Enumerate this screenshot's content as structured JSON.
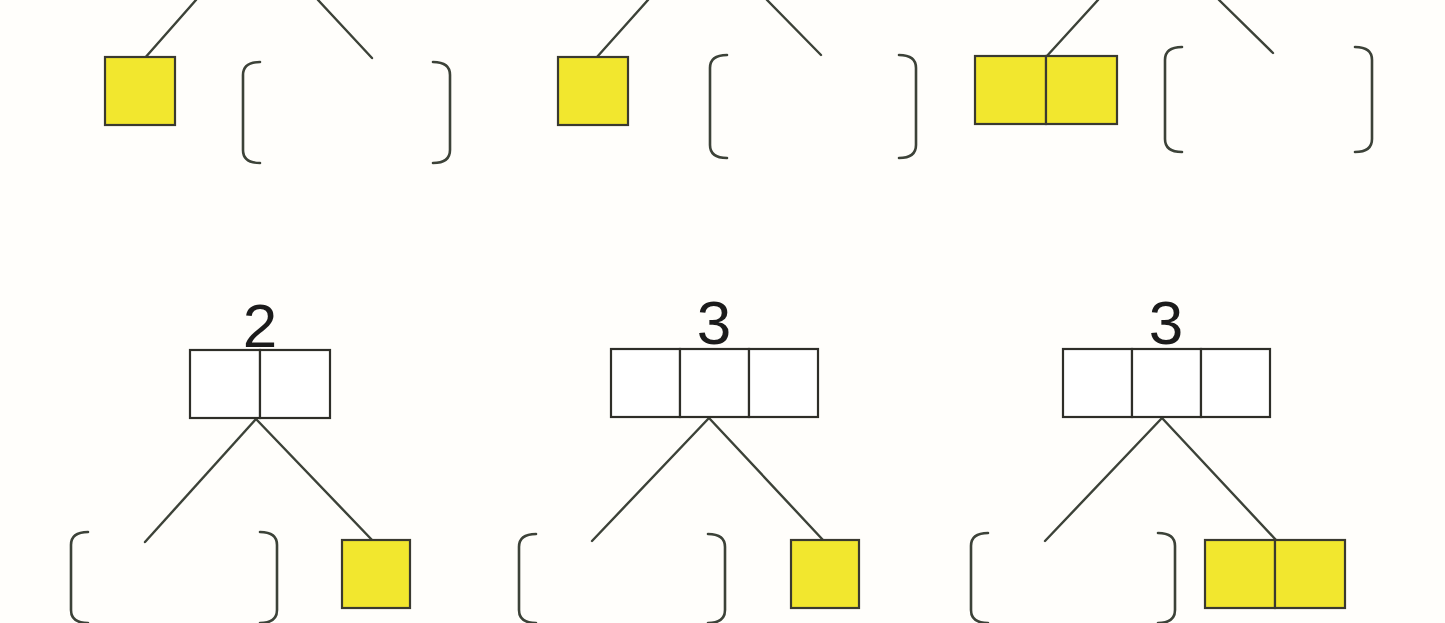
{
  "page": {
    "background_color": "#fffefb",
    "width": 1445,
    "height": 623
  },
  "palette": {
    "tile_fill": "#f2e72e",
    "tile_stroke": "#3a3a30",
    "empty_fill": "#ffffff",
    "empty_stroke": "#2e2e28",
    "connector_stroke": "#3c4238",
    "bracket_stroke": "#3c4238",
    "numeral_color": "#1b1b1b"
  },
  "stroke_widths": {
    "tile": 2.2,
    "empty": 2.2,
    "connector": 2.4,
    "bracket": 2.6
  },
  "groups": [
    {
      "id": "group-top-left",
      "row": "top",
      "column": 1,
      "label": null,
      "tile_group": {
        "name": "yellow-tile-group",
        "cells": 1,
        "fill": "#f2e72e",
        "x": 105,
        "y": 57,
        "cell_width": 70,
        "cell_height": 68
      },
      "bracket_pair": {
        "name": "empty-bracket-pair",
        "left_x": 243,
        "right_x": 450,
        "top_y": 62,
        "bottom_y": 163,
        "arm_length": 17
      },
      "connectors": [
        {
          "name": "connector-left",
          "x1": 196,
          "y1": 0,
          "x2": 144,
          "y2": 59
        },
        {
          "name": "connector-right",
          "x1": 318,
          "y1": 0,
          "x2": 372,
          "y2": 58
        }
      ]
    },
    {
      "id": "group-top-middle",
      "row": "top",
      "column": 2,
      "label": null,
      "tile_group": {
        "name": "yellow-tile-group",
        "cells": 1,
        "fill": "#f2e72e",
        "x": 558,
        "y": 57,
        "cell_width": 70,
        "cell_height": 68
      },
      "bracket_pair": {
        "name": "empty-bracket-pair",
        "left_x": 710,
        "right_x": 916,
        "top_y": 55,
        "bottom_y": 158,
        "arm_length": 17
      },
      "connectors": [
        {
          "name": "connector-left",
          "x1": 648,
          "y1": 0,
          "x2": 597,
          "y2": 57
        },
        {
          "name": "connector-right",
          "x1": 767,
          "y1": 0,
          "x2": 821,
          "y2": 55
        }
      ]
    },
    {
      "id": "group-top-right",
      "row": "top",
      "column": 3,
      "label": null,
      "tile_group": {
        "name": "yellow-tile-group",
        "cells": 2,
        "fill": "#f2e72e",
        "x": 975,
        "y": 56,
        "cell_width": 71,
        "cell_height": 68
      },
      "bracket_pair": {
        "name": "empty-bracket-pair",
        "left_x": 1165,
        "right_x": 1372,
        "top_y": 47,
        "bottom_y": 152,
        "arm_length": 17
      },
      "connectors": [
        {
          "name": "connector-left",
          "x1": 1098,
          "y1": 0,
          "x2": 1046,
          "y2": 57
        },
        {
          "name": "connector-right",
          "x1": 1219,
          "y1": 0,
          "x2": 1273,
          "y2": 53
        }
      ]
    },
    {
      "id": "group-bottom-left",
      "row": "bottom",
      "column": 1,
      "label": "2",
      "label_x": 260,
      "label_y": 295,
      "empty_group": {
        "name": "empty-tile-group",
        "cells": 2,
        "x": 190,
        "y": 350,
        "cell_width": 70,
        "cell_height": 68
      },
      "tile_group": {
        "name": "yellow-tile-group",
        "cells": 1,
        "fill": "#f2e72e",
        "x": 342,
        "y": 540,
        "cell_width": 68,
        "cell_height": 68
      },
      "bracket_pair": {
        "name": "empty-bracket-pair",
        "left_x": 71,
        "right_x": 277,
        "top_y": 532,
        "bottom_y": 623,
        "arm_length": 17
      },
      "connectors": [
        {
          "name": "connector-left",
          "x1": 256,
          "y1": 419,
          "x2": 145,
          "y2": 542
        },
        {
          "name": "connector-right",
          "x1": 256,
          "y1": 419,
          "x2": 373,
          "y2": 541
        }
      ]
    },
    {
      "id": "group-bottom-middle",
      "row": "bottom",
      "column": 2,
      "label": "3",
      "label_x": 714,
      "label_y": 292,
      "empty_group": {
        "name": "empty-tile-group",
        "cells": 3,
        "x": 611,
        "y": 349,
        "cell_width": 69,
        "cell_height": 68
      },
      "tile_group": {
        "name": "yellow-tile-group",
        "cells": 1,
        "fill": "#f2e72e",
        "x": 791,
        "y": 540,
        "cell_width": 68,
        "cell_height": 68
      },
      "bracket_pair": {
        "name": "empty-bracket-pair",
        "left_x": 519,
        "right_x": 725,
        "top_y": 534,
        "bottom_y": 623,
        "arm_length": 17
      },
      "connectors": [
        {
          "name": "connector-left",
          "x1": 709,
          "y1": 418,
          "x2": 592,
          "y2": 541
        },
        {
          "name": "connector-right",
          "x1": 709,
          "y1": 418,
          "x2": 823,
          "y2": 540
        }
      ]
    },
    {
      "id": "group-bottom-right",
      "row": "bottom",
      "column": 3,
      "label": "3",
      "label_x": 1166,
      "label_y": 292,
      "empty_group": {
        "name": "empty-tile-group",
        "cells": 3,
        "x": 1063,
        "y": 349,
        "cell_width": 69,
        "cell_height": 68
      },
      "tile_group": {
        "name": "yellow-tile-group",
        "cells": 2,
        "fill": "#f2e72e",
        "x": 1205,
        "y": 540,
        "cell_width": 70,
        "cell_height": 68
      },
      "bracket_pair": {
        "name": "empty-bracket-pair",
        "left_x": 971,
        "right_x": 1175,
        "top_y": 533,
        "bottom_y": 623,
        "arm_length": 17
      },
      "connectors": [
        {
          "name": "connector-left",
          "x1": 1162,
          "y1": 418,
          "x2": 1045,
          "y2": 541
        },
        {
          "name": "connector-right",
          "x1": 1162,
          "y1": 418,
          "x2": 1276,
          "y2": 540
        }
      ]
    }
  ]
}
